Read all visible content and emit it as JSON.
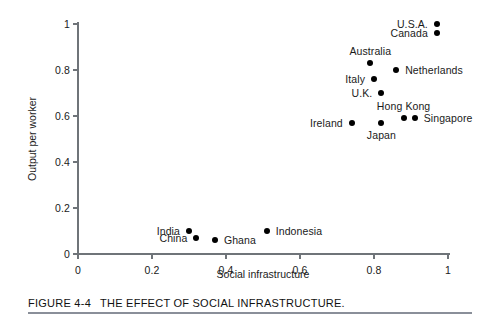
{
  "chart_data": {
    "type": "scatter",
    "title": "",
    "xlabel": "Social infrastructure",
    "ylabel": "Output per worker",
    "xlim": [
      0,
      1
    ],
    "ylim": [
      0,
      1
    ],
    "xticks": [
      "0",
      "0.2",
      "0.4",
      "0.6",
      "0.8",
      "1"
    ],
    "xtick_values": [
      0,
      0.2,
      0.4,
      0.6,
      0.8,
      1
    ],
    "yticks": [
      "0",
      "0.2",
      "0.4",
      "0.6",
      "0.8",
      "1"
    ],
    "ytick_values": [
      0,
      0.2,
      0.4,
      0.6,
      0.8,
      1
    ],
    "grid": false,
    "legend": "none",
    "marker": "filled-circle",
    "marker_color": "#000000",
    "points": [
      {
        "label": "U.S.A.",
        "x": 0.97,
        "y": 1.0,
        "label_pos": "left"
      },
      {
        "label": "Canada",
        "x": 0.97,
        "y": 0.96,
        "label_pos": "left"
      },
      {
        "label": "Australia",
        "x": 0.79,
        "y": 0.83,
        "label_pos": "above"
      },
      {
        "label": "Netherlands",
        "x": 0.86,
        "y": 0.8,
        "label_pos": "right"
      },
      {
        "label": "Italy",
        "x": 0.8,
        "y": 0.76,
        "label_pos": "left"
      },
      {
        "label": "U.K.",
        "x": 0.82,
        "y": 0.7,
        "label_pos": "left"
      },
      {
        "label": "Hong Kong",
        "x": 0.88,
        "y": 0.59,
        "label_pos": "above"
      },
      {
        "label": "Singapore",
        "x": 0.91,
        "y": 0.59,
        "label_pos": "right"
      },
      {
        "label": "Japan",
        "x": 0.82,
        "y": 0.57,
        "label_pos": "below"
      },
      {
        "label": "Ireland",
        "x": 0.74,
        "y": 0.57,
        "label_pos": "left"
      },
      {
        "label": "India",
        "x": 0.3,
        "y": 0.1,
        "label_pos": "left"
      },
      {
        "label": "China",
        "x": 0.32,
        "y": 0.07,
        "label_pos": "left"
      },
      {
        "label": "Ghana",
        "x": 0.37,
        "y": 0.06,
        "label_pos": "right"
      },
      {
        "label": "Indonesia",
        "x": 0.51,
        "y": 0.1,
        "label_pos": "right"
      }
    ]
  },
  "caption": {
    "figure_number": "FIGURE 4-4",
    "title": "THE EFFECT OF SOCIAL INFRASTRUCTURE."
  },
  "colors": {
    "ink": "#1a1a1a",
    "axis": "#6f7479",
    "marker": "#000000",
    "caption_rule": "#8a8f99"
  }
}
